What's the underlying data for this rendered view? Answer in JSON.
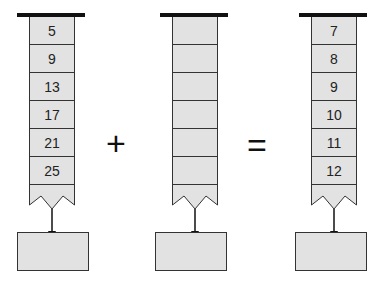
{
  "diagram": {
    "columns": [
      {
        "id": "left",
        "values": [
          "5",
          "9",
          "13",
          "17",
          "21",
          "25"
        ],
        "output": ""
      },
      {
        "id": "middle",
        "values": [
          "",
          "",
          "",
          "",
          "",
          ""
        ],
        "output": ""
      },
      {
        "id": "right",
        "values": [
          "7",
          "8",
          "9",
          "10",
          "11",
          "12"
        ],
        "output": ""
      }
    ],
    "operators": {
      "plus": "+",
      "equals": "="
    },
    "colors": {
      "cell_fill": "#e2e2e2",
      "stroke": "#333333",
      "bar": "#111111"
    }
  }
}
